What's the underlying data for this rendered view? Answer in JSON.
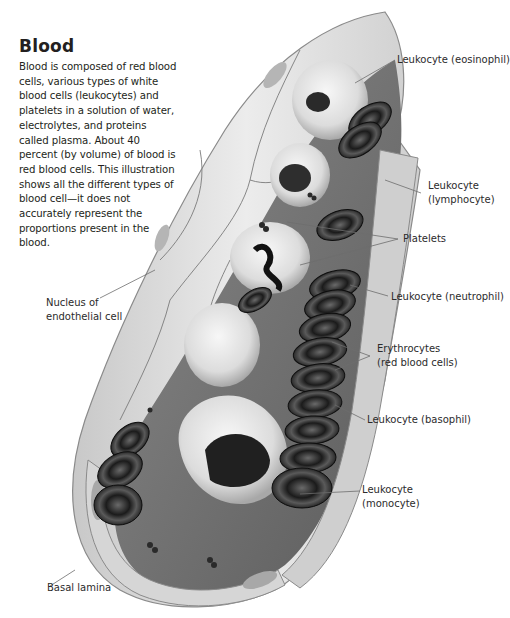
{
  "title": "Blood",
  "intro": "Blood is composed of red blood cells, various types of white blood cells (leukocytes) and platelets in a solution of water, electrolytes, and proteins called plasma. About 40 percent (by volume) of blood is red blood cells. This illustration shows all the different types of blood cell—it does not accurately represent the proportions present in the blood.",
  "labels": {
    "eosinophil": [
      "Leukocyte (eosinophil)"
    ],
    "lymphocyte": [
      "Leukocyte",
      "(lymphocyte)"
    ],
    "platelets": [
      "Platelets"
    ],
    "neutrophil": [
      "Leukocyte (neutrophil)"
    ],
    "erythrocytes": [
      "Erythrocytes",
      "(red blood cells)"
    ],
    "basophil": [
      "Leukocyte (basophil)"
    ],
    "monocyte": [
      "Leukocyte",
      "(monocyte)"
    ],
    "nucleus": [
      "Nucleus of",
      "endothelial cell"
    ],
    "basal_lamina": [
      "Basal lamina"
    ]
  },
  "colors": {
    "vessel_wall": "#d9d9d9",
    "vessel_edge": "#8a8a8a",
    "lumen": "#6e6e6e",
    "rbc_dark": "#1e1e1e",
    "rbc_light": "#5a5a5a",
    "leukocyte": "#e8e8e8",
    "leader_line": "#6d6d6d"
  }
}
